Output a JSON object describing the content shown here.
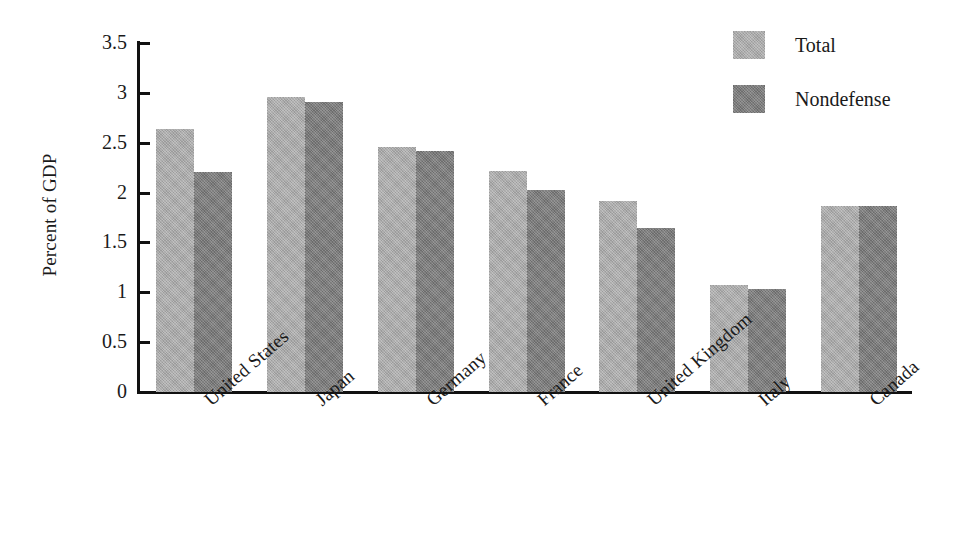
{
  "chart_data": {
    "type": "bar",
    "title": "",
    "subtitle": "",
    "xlabel": "",
    "ylabel": "Percent of GDP",
    "ylim": [
      0,
      3.5
    ],
    "ytick_labels": [
      "3.5",
      "3",
      "2.5",
      "2",
      "1.5",
      "1",
      "0.5",
      "0"
    ],
    "ytick_values": [
      3.5,
      3,
      2.5,
      2,
      1.5,
      1,
      0.5,
      0
    ],
    "grid": false,
    "legend_position": "top-right",
    "categories": [
      "United States",
      "Japan",
      "Germany",
      "France",
      "United Kingdom",
      "Italy",
      "Canada"
    ],
    "series": [
      {
        "name": "Total",
        "color": "#aaaaaa",
        "values": [
          2.64,
          2.96,
          2.46,
          2.22,
          1.92,
          1.07,
          1.87
        ]
      },
      {
        "name": "Nondefense",
        "color": "#797979",
        "values": [
          2.21,
          2.91,
          2.42,
          2.03,
          1.64,
          1.03,
          1.87
        ]
      }
    ]
  },
  "legend": {
    "items": [
      {
        "label": "Total",
        "color": "#aaaaaa"
      },
      {
        "label": "Nondefense",
        "color": "#797979"
      }
    ]
  },
  "axes": {
    "y_title": "Percent of GDP"
  }
}
